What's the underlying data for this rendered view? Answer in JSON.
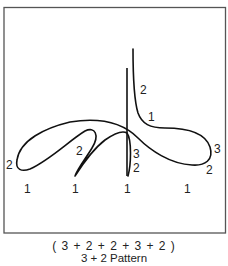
{
  "figure": {
    "frame": {
      "x": 4,
      "y": 7,
      "width": 222,
      "height": 226,
      "stroke": "#555555"
    },
    "stroke_color": "#111111",
    "count_labels": [
      {
        "text": "2",
        "x": 140,
        "y": 94
      },
      {
        "text": "1",
        "x": 148,
        "y": 121
      },
      {
        "text": "3",
        "x": 214,
        "y": 153
      },
      {
        "text": "2",
        "x": 206,
        "y": 174
      },
      {
        "text": "2",
        "x": 76,
        "y": 155
      },
      {
        "text": "3",
        "x": 133,
        "y": 158
      },
      {
        "text": "2",
        "x": 133,
        "y": 172
      },
      {
        "text": "2",
        "x": 6,
        "y": 169
      }
    ],
    "beat_labels": [
      {
        "text": "1",
        "x": 24,
        "y": 193
      },
      {
        "text": "1",
        "x": 72,
        "y": 193
      },
      {
        "text": "1",
        "x": 124,
        "y": 193
      },
      {
        "text": "1",
        "x": 184,
        "y": 193
      }
    ]
  },
  "caption": {
    "formula": "( 3 + 2 + 2 + 3 + 2 )",
    "title": "3 + 2 Pattern"
  }
}
